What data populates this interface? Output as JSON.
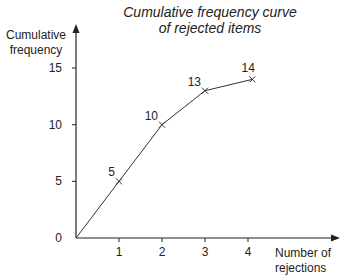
{
  "chart_data": {
    "type": "line",
    "title": "Cumulative frequency curve of rejected items",
    "title_lines": [
      "Cumulative frequency curve",
      "of rejected items"
    ],
    "xlabel": "Number of rejections",
    "xlabel_lines": [
      "Number of",
      "rejections"
    ],
    "ylabel": "Cumulative frequency",
    "ylabel_lines": [
      "Cumulative",
      "frequency"
    ],
    "x": [
      0,
      1,
      2,
      3,
      4.1
    ],
    "series": [
      {
        "name": "Cumulative frequency",
        "values": [
          0,
          5,
          10,
          13,
          14
        ]
      }
    ],
    "point_labels": [
      "5",
      "10",
      "13",
      "14"
    ],
    "xticks": [
      1,
      2,
      3,
      4
    ],
    "yticks": [
      0,
      5,
      10,
      15
    ],
    "xlim": [
      0,
      5
    ],
    "ylim": [
      0,
      17
    ],
    "grid": false,
    "legend": "none",
    "marker": "x",
    "colors": {
      "line": "#333333",
      "axis": "#222222"
    }
  }
}
